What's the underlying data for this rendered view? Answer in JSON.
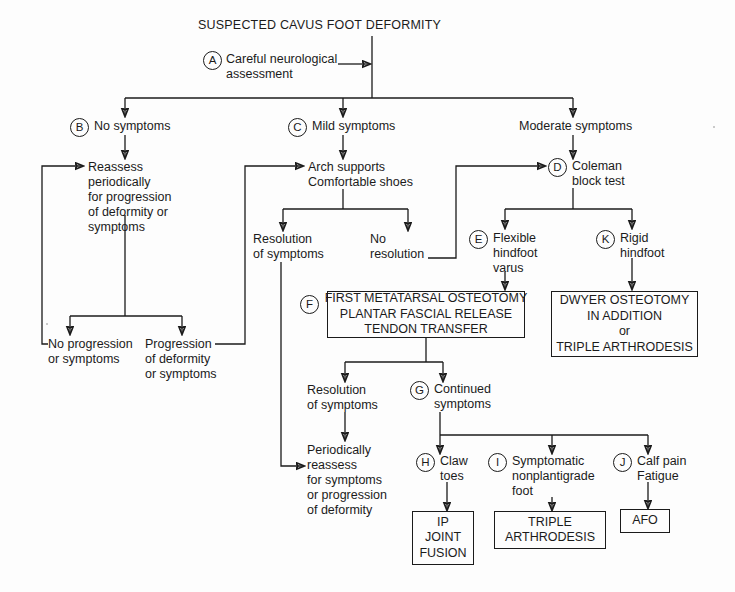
{
  "diagram": {
    "title": "SUSPECTED CAVUS FOOT DEFORMITY",
    "nodes": {
      "a_label": "Careful neurological\nassessment",
      "a_marker": "A",
      "b_marker": "B",
      "b_label": "No symptoms",
      "c_marker": "C",
      "c_label": "Mild symptoms",
      "moderate_label": "Moderate symptoms",
      "reassess": "Reassess\nperiodically\nfor progression\nof deformity or\nsymptoms",
      "arch_supports": "Arch supports\nComfortable shoes",
      "d_marker": "D",
      "d_label": "Coleman\nblock test",
      "no_progression": "No progression\nor symptoms",
      "progression": "Progression\nof deformity\nor symptoms",
      "resolution_1": "Resolution\nof symptoms",
      "no_resolution": "No\nresolution",
      "e_marker": "E",
      "e_label": "Flexible\nhindfoot\nvarus",
      "k_marker": "K",
      "k_label": "Rigid\nhindfoot",
      "f_marker": "F",
      "f_box": "FIRST METATARSAL OSTEOTOMY\nPLANTAR FASCIAL RELEASE\nTENDON TRANSFER",
      "k_box": "DWYER OSTEOTOMY\nIN ADDITION\nor\nTRIPLE ARTHRODESIS",
      "resolution_2": "Resolution\nof symptoms",
      "g_marker": "G",
      "g_label": "Continued\nsymptoms",
      "periodically_reassess": "Periodically\nreassess\nfor symptoms\nor progression\nof deformity",
      "h_marker": "H",
      "h_label": "Claw\ntoes",
      "i_marker": "I",
      "i_label": "Symptomatic\nnonplantigrade\nfoot",
      "j_marker": "J",
      "j_label": "Calf pain\nFatigue",
      "ip_box": "IP\nJOINT\nFUSION",
      "triple_box": "TRIPLE\nARTHRODESIS",
      "afo_box": "AFO"
    },
    "colors": {
      "line": "#1b1b1b",
      "text": "#1b1b1b",
      "background": "#fdfdfd"
    }
  }
}
